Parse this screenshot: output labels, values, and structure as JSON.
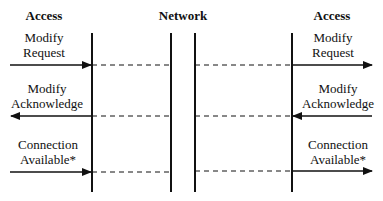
{
  "diagram": {
    "type": "sequence",
    "headers": {
      "left": "Access",
      "center": "Network",
      "right": "Access"
    },
    "lifelines_x": [
      92,
      171,
      195,
      292
    ],
    "messages": [
      {
        "label_line1": "Modify",
        "label_line2": "Request",
        "direction": "left-to-right",
        "y": 65
      },
      {
        "label_line1": "Modify",
        "label_line2": "Acknowledge",
        "direction": "right-to-left",
        "y": 116
      },
      {
        "label_line1": "Connection",
        "label_line2": "Available*",
        "direction": "left-to-right",
        "y": 172
      }
    ],
    "colors": {
      "line": "#111111",
      "background": "#ffffff"
    }
  }
}
